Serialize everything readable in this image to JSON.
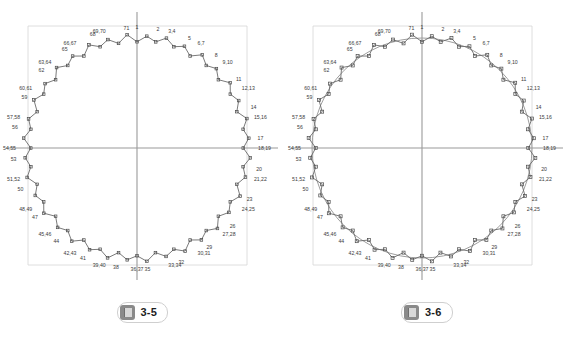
{
  "page": {
    "background_color": "#ffffff",
    "width": 569,
    "height": 337
  },
  "figures": [
    {
      "id": "figure-3-5",
      "caption_number": "3-5",
      "caption_icon_name": "book-icon",
      "plot_type": "roundness-polar-profile",
      "description": "Measured roundness profile plotted as a closed polyline of 72 numbered measurement points around a circle, with horizontal and vertical centre crosshair axes and a faint rectangular bounding guide frame.",
      "has_fitted_circle": false,
      "colors": {
        "profile_line": "#6b6b6b",
        "marker": "#4a4a4a",
        "label_text": "#3c3c3c",
        "axis": "#9a9a9a",
        "guide_frame": "#d5d5d5",
        "fitted_circle": "#b5b5b5"
      },
      "axes": {
        "vertical_x": 137,
        "horizontal_y": 148
      },
      "guide_frame": {
        "left": 28,
        "right": 247,
        "top": 26,
        "bottom": 265
      },
      "point_labels": [
        "1",
        "2",
        "3,4",
        "5",
        "6,7",
        "8",
        "9,10",
        "11",
        "12,13",
        "14",
        "15,16",
        "17",
        "18,19",
        "20",
        "21,22",
        "23",
        "24,25",
        "26",
        "27,28",
        "29",
        "30,31",
        "32",
        "33,34",
        "35",
        "36,37",
        "38",
        "39,40",
        "41",
        "42,43",
        "44",
        "45,46",
        "47",
        "48,49",
        "50",
        "51,52",
        "53",
        "54,55",
        "56",
        "57,58",
        "59",
        "60,61",
        "62",
        "63,64",
        "65",
        "66,67",
        "68",
        "69,70",
        "71"
      ]
    },
    {
      "id": "figure-3-6",
      "caption_number": "3-6",
      "caption_icon_name": "book-icon",
      "plot_type": "roundness-polar-profile-with-fitted-circle",
      "description": "Same 72-point measured roundness profile as figure 3-5, overlaid with a smooth best-fit reference circle and square point markers, with centre crosshair axes and a faint rectangular bounding guide frame.",
      "has_fitted_circle": true,
      "colors": {
        "profile_line": "#6b6b6b",
        "marker": "#4a4a4a",
        "label_text": "#3c3c3c",
        "axis": "#9a9a9a",
        "guide_frame": "#d5d5d5",
        "fitted_circle": "#9e9e9e"
      },
      "axes": {
        "vertical_x": 137,
        "horizontal_y": 148
      },
      "guide_frame": {
        "left": 28,
        "right": 247,
        "top": 26,
        "bottom": 265
      },
      "point_labels": [
        "1",
        "2",
        "3,4",
        "5",
        "6,7",
        "8",
        "9,10",
        "11",
        "12,13",
        "14",
        "15,16",
        "17",
        "18,19",
        "20",
        "21,22",
        "23",
        "24,25",
        "26",
        "27,28",
        "29",
        "30,31",
        "32",
        "33,34",
        "35",
        "36,37",
        "38",
        "39,40",
        "41",
        "42,43",
        "44",
        "45,46",
        "47",
        "48,49",
        "50",
        "51,52",
        "53",
        "54,55",
        "56",
        "57,58",
        "59",
        "60,61",
        "62",
        "63,64",
        "65",
        "66,67",
        "68",
        "69,70",
        "71"
      ]
    }
  ],
  "chart_data": {
    "type": "scatter",
    "title": "",
    "xlabel": "",
    "ylabel": "",
    "point_count": 72,
    "angle_step_deg": 5,
    "nominal_radius": 110,
    "center": {
      "x": 137,
      "y": 148
    },
    "radius_deviation_pattern": [
      0,
      4,
      1,
      5,
      1,
      4,
      0,
      5,
      1,
      4,
      0,
      5,
      1,
      4,
      0,
      5,
      1,
      4,
      0,
      5,
      1,
      4,
      0,
      5,
      1,
      4,
      0,
      5,
      1,
      4,
      0,
      5,
      1,
      4,
      0,
      5,
      1,
      4,
      0,
      5,
      1,
      4,
      0,
      5,
      1,
      4,
      0,
      5,
      1,
      4,
      0,
      5,
      1,
      4,
      0,
      5,
      1,
      4,
      0,
      5,
      1,
      4,
      0,
      5,
      1,
      4,
      0,
      5,
      1,
      4,
      0,
      5
    ],
    "series": [
      {
        "name": "measured profile",
        "style": "polyline-with-markers"
      },
      {
        "name": "fitted reference circle",
        "style": "smooth-circle",
        "figures": [
          "3-6"
        ]
      }
    ],
    "grid": false,
    "legend": "none"
  }
}
